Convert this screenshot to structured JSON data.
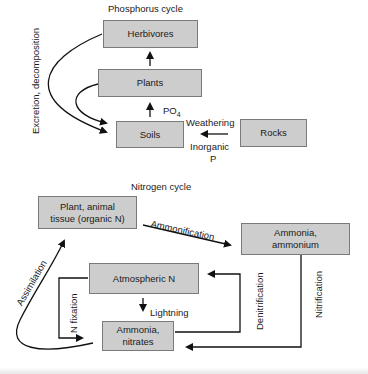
{
  "phosphorus_cycle": {
    "title": "Phosphorus cycle",
    "nodes": {
      "herbivores": "Herbivores",
      "plants": "Plants",
      "soils": "Soils",
      "rocks": "Rocks"
    },
    "labels": {
      "excretion": "Excretion, decomposition",
      "po4_main": "PO",
      "po4_sub": "4",
      "weathering": "Weathering",
      "inorganic": "Inorganic",
      "p": "P"
    }
  },
  "nitrogen_cycle": {
    "title": "Nitrogen cycle",
    "nodes": {
      "tissue_line1": "Plant, animal",
      "tissue_line2": "tissue (organic N)",
      "ammonium_line1": "Ammonia,",
      "ammonium_line2": "ammonium",
      "atmospheric": "Atmospheric N",
      "nitrates_line1": "Ammonia,",
      "nitrates_line2": "nitrates"
    },
    "labels": {
      "ammonification": "Ammonification",
      "assimilation": "Assimilation",
      "n_fixation": "N fixation",
      "lightning": "Lightning",
      "denitrification": "Denitrification",
      "nitrification": "Nitrification"
    }
  },
  "colors": {
    "box_fill": "#cdcdcd",
    "box_border": "#7a7a7a",
    "line": "#111111"
  }
}
